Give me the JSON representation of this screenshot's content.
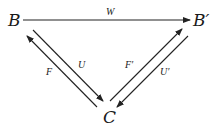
{
  "diagram": {
    "type": "commutative-diagram",
    "nodes": [
      {
        "id": "B",
        "label": "B",
        "x": 14,
        "y": 26
      },
      {
        "id": "B_prime",
        "label": "B′",
        "x": 201,
        "y": 26
      },
      {
        "id": "C",
        "label": "C",
        "x": 109,
        "y": 123
      }
    ],
    "edges": [
      {
        "id": "W",
        "label": "W",
        "from": "B",
        "to": "B_prime"
      },
      {
        "id": "U",
        "label": "U",
        "from": "B",
        "to": "C"
      },
      {
        "id": "F",
        "label": "F",
        "from": "C",
        "to": "B"
      },
      {
        "id": "F_prime",
        "label": "F′",
        "from": "C",
        "to": "B_prime"
      },
      {
        "id": "U_prime",
        "label": "U′",
        "from": "B_prime",
        "to": "C"
      }
    ],
    "colors": {
      "ink": "#1a1a1a",
      "background": "#ffffff"
    }
  }
}
